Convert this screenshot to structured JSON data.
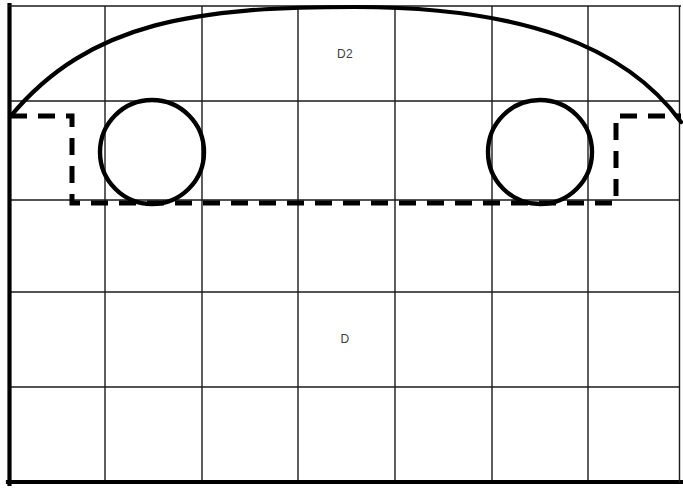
{
  "diagram": {
    "background_color": "#ffffff",
    "line_color": "#000000",
    "grid_color": "#1a1a1a",
    "label_color": "#3d3d3d",
    "width": 683,
    "height": 491,
    "labels": [
      {
        "id": "d2",
        "text": "D2",
        "x": 345,
        "y": 55
      },
      {
        "id": "d",
        "text": "D",
        "x": 345,
        "y": 340
      }
    ],
    "frame": {
      "x": 8,
      "y": 6,
      "width": 672,
      "height": 477
    },
    "grid": {
      "columns": 7,
      "rows": 5,
      "vertical_x": [
        105,
        202,
        298,
        395,
        492,
        588
      ],
      "horizontal_y": [
        101,
        200,
        292,
        387
      ]
    },
    "arc": {
      "description": "roof-line arc",
      "start_x": 10,
      "start_y": 117,
      "peak_x": 355,
      "peak_y": 7,
      "end_x": 681,
      "end_y": 122
    },
    "wheels": [
      {
        "id": "front-wheel",
        "cx": 152,
        "cy": 152,
        "r": 52
      },
      {
        "id": "rear-wheel",
        "cx": 540,
        "cy": 152,
        "r": 52
      }
    ],
    "dashed_outline": {
      "description": "body underside clearance outline",
      "points": "10,116 72,116 72,203 616,203 616,116 681,116"
    }
  }
}
